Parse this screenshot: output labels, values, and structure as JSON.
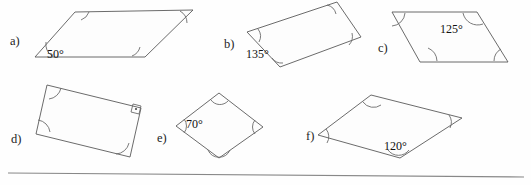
{
  "worksheet": {
    "background_color": "#fefefe",
    "line_color": "#5a5a5a",
    "rule": {
      "name": "horizontal-rule",
      "x1": 8,
      "y1": 173,
      "x2": 524,
      "y2": 177
    },
    "problems": [
      {
        "key": "a",
        "label": "a)",
        "label_x": 10,
        "label_y": 35,
        "shape": "parallelogram",
        "points": "35,57 75,12 193,10 145,57",
        "angle_label": "50°",
        "angle_label_x": 47,
        "angle_label_y": 48,
        "arcs": [
          {
            "name": "angle-arc-bottom-left",
            "d": "M 52,56 A 15,15 0 0 1 46,42"
          },
          {
            "name": "angle-arc-top-left",
            "d": "M 81,20 A 13,13 0 0 0 89,12"
          },
          {
            "name": "angle-arc-top-right",
            "d": "M 180,11 A 14,14 0 0 1 187,23"
          },
          {
            "name": "angle-arc-bottom-right",
            "d": "M 132,56 A 13,13 0 0 0 140,47"
          }
        ],
        "right_angle": null
      },
      {
        "key": "b",
        "label": "b)",
        "label_x": 224,
        "label_y": 38,
        "shape": "parallelogram",
        "points": "247,32 337,2 361,37 280,67",
        "angle_label": "135°",
        "angle_label_x": 246,
        "angle_label_y": 48,
        "arcs": [
          {
            "name": "angle-arc-left",
            "d": "M 258,29 A 12,12 0 0 1 259,42"
          },
          {
            "name": "angle-arc-top",
            "d": "M 327,5 A 12,12 0 0 1 336,14"
          },
          {
            "name": "angle-arc-right",
            "d": "M 352,33 A 13,13 0 0 1 349,45"
          },
          {
            "name": "angle-arc-bottom",
            "d": "M 272,58 A 12,12 0 0 0 283,63"
          }
        ],
        "right_angle": null
      },
      {
        "key": "c",
        "label": "c)",
        "label_x": 378,
        "label_y": 42,
        "shape": "parallelogram",
        "points": "392,12 477,12 508,62 420,62"
      },
      {
        "key": "c_detail",
        "angle_label": "125°",
        "angle_label_x": 440,
        "angle_label_y": 23,
        "arcs": [
          {
            "name": "angle-arc-top-left",
            "d": "M 392,26 A 14,14 0 0 0 405,13"
          },
          {
            "name": "angle-arc-top-right",
            "d": "M 463,13 A 15,15 0 0 0 483,24"
          },
          {
            "name": "angle-arc-bottom-left",
            "d": "M 428,48 A 15,15 0 0 1 437,61"
          },
          {
            "name": "angle-arc-bottom-right",
            "d": "M 494,61 A 14,14 0 0 1 501,49"
          }
        ]
      },
      {
        "key": "d",
        "label": "d)",
        "label_x": 11,
        "label_y": 133,
        "shape": "rectangle",
        "points": "47,85 141,108 130,157 36,134",
        "angle_label": null,
        "arcs": [
          {
            "name": "angle-arc-top-left",
            "d": "M 49,99 A 14,14 0 0 0 61,88"
          },
          {
            "name": "angle-arc-bottom-left",
            "d": "M 38,120 A 14,14 0 0 1 50,132"
          },
          {
            "name": "angle-arc-bottom-right",
            "d": "M 116,154 A 14,14 0 0 0 129,143"
          }
        ],
        "right_angle": {
          "name": "right-angle-marker",
          "box": "133,104 141,106 139,114 131,112",
          "dot_cx": 136,
          "dot_cy": 109,
          "dot_r": 1.1
        }
      },
      {
        "key": "e",
        "label": "e)",
        "label_x": 157,
        "label_y": 132,
        "shape": "rhombus",
        "points": "176,126 219,93 263,127 219,158",
        "angle_label": "70°",
        "angle_label_x": 186,
        "angle_label_y": 118,
        "arcs": [
          {
            "name": "angle-arc-left",
            "d": "M 184,119 A 11,11 0 0 1 184,133"
          },
          {
            "name": "angle-arc-top",
            "d": "M 211,100 A 11,11 0 0 0 228,101"
          },
          {
            "name": "angle-arc-right",
            "d": "M 255,120 A 11,11 0 0 0 255,134"
          },
          {
            "name": "angle-arc-bottom",
            "d": "M 208,150 A 12,12 0 0 0 230,150"
          }
        ],
        "right_angle": null
      },
      {
        "key": "f",
        "label": "f)",
        "label_x": 306,
        "label_y": 130,
        "shape": "parallelogram",
        "points": "318,135 371,95 462,118 400,158",
        "angle_label": "120°",
        "angle_label_x": 384,
        "angle_label_y": 140,
        "arcs": [
          {
            "name": "angle-arc-left",
            "d": "M 326,129 A 12,12 0 0 1 327,143"
          },
          {
            "name": "angle-arc-top",
            "d": "M 363,102 A 13,13 0 0 0 381,105"
          },
          {
            "name": "angle-arc-right",
            "d": "M 449,115 A 13,13 0 0 1 450,128"
          },
          {
            "name": "angle-arc-bottom",
            "d": "M 388,150 A 13,13 0 0 0 409,150"
          }
        ],
        "right_angle": null
      }
    ]
  }
}
